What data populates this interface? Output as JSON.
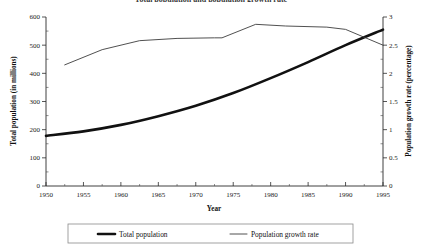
{
  "chart_data": {
    "type": "line",
    "title": "Total population and population growth rate",
    "xlabel": "Year",
    "ylabel": "Total population (in millions)",
    "y2label": "Population growth rate (percentage)",
    "xlim": [
      1950,
      1995
    ],
    "ylim": [
      0,
      600
    ],
    "y2lim": [
      0,
      3
    ],
    "xticks": [
      1950,
      1955,
      1960,
      1965,
      1970,
      1975,
      1980,
      1985,
      1990,
      1995
    ],
    "xtick_labels": [
      "1950",
      "1955",
      "1960",
      "1965",
      "1970",
      "1975",
      "1980",
      "1985",
      "1990",
      "1995"
    ],
    "yticks": [
      0,
      100,
      200,
      300,
      400,
      500,
      600
    ],
    "ytick_labels": [
      "0",
      "100",
      "200",
      "300",
      "400",
      "500",
      "600"
    ],
    "y2ticks": [
      0,
      0.5,
      1,
      1.5,
      2,
      2.5,
      3
    ],
    "y2tick_labels": [
      "0",
      "0.5",
      "1",
      "1.5",
      "2",
      "2.5",
      "3"
    ],
    "grid": false,
    "legend_position": "bottom",
    "series": [
      {
        "name": "Total population",
        "axis": "left",
        "style": "thick",
        "x": [
          1950,
          1955,
          1960,
          1965,
          1970,
          1975,
          1980,
          1985,
          1990,
          1995
        ],
        "values": [
          178,
          194,
          217,
          248,
          285,
          330,
          383,
          440,
          500,
          555
        ]
      },
      {
        "name": "Population growth rate",
        "axis": "right",
        "style": "thin",
        "x": [
          1952.5,
          1957.5,
          1962.5,
          1967.5,
          1972.5,
          1973.5,
          1978,
          1982,
          1987.5,
          1990,
          1995
        ],
        "values": [
          2.15,
          2.42,
          2.58,
          2.62,
          2.63,
          2.63,
          2.87,
          2.84,
          2.82,
          2.78,
          2.5
        ]
      }
    ]
  },
  "legend": {
    "items": [
      {
        "label": "Total population",
        "style": "thick"
      },
      {
        "label": "Population growth rate",
        "style": "thin"
      }
    ]
  }
}
